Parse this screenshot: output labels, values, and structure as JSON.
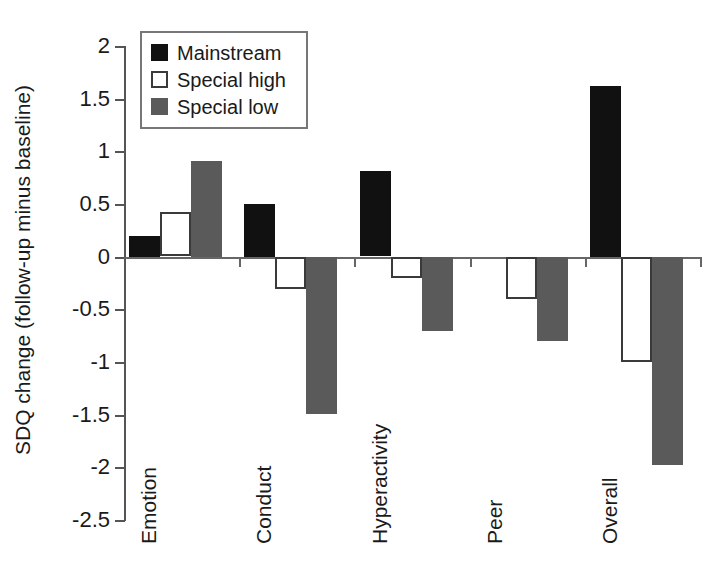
{
  "chart_data": {
    "type": "bar",
    "title": "",
    "xlabel": "",
    "ylabel": "SDQ change (follow-up minus baseline)",
    "ylim": [
      -2.5,
      2
    ],
    "ytick_step": 0.5,
    "yticks": [
      "2",
      "1.5",
      "1",
      "0.5",
      "0",
      "-0.5",
      "-1",
      "-1.5",
      "-2",
      "-2.5"
    ],
    "ytick_values": [
      2,
      1.5,
      1,
      0.5,
      0,
      -0.5,
      -1,
      -1.5,
      -2,
      -2.5
    ],
    "grid": false,
    "legend_position": "top-left-inside",
    "categories": [
      "Emotion",
      "Conduct",
      "Hyperactivity",
      "Peer",
      "Overall"
    ],
    "series": [
      {
        "name": "Mainstream",
        "color": "#111111",
        "style": "filled-black",
        "values": [
          0.2,
          0.5,
          0.81,
          0.0,
          1.62
        ]
      },
      {
        "name": "Special high",
        "color": "#ffffff",
        "style": "outlined-white",
        "values": [
          0.42,
          -0.3,
          -0.2,
          -0.4,
          -1.0
        ]
      },
      {
        "name": "Special low",
        "color": "#5a5a5a",
        "style": "filled-gray",
        "values": [
          0.91,
          -1.49,
          -0.7,
          -0.8,
          -1.97
        ]
      }
    ]
  },
  "legend": {
    "items": [
      {
        "label": "Mainstream"
      },
      {
        "label": "Special high"
      },
      {
        "label": "Special low"
      }
    ]
  },
  "axis": {
    "y_title": "SDQ change (follow-up minus baseline)"
  }
}
